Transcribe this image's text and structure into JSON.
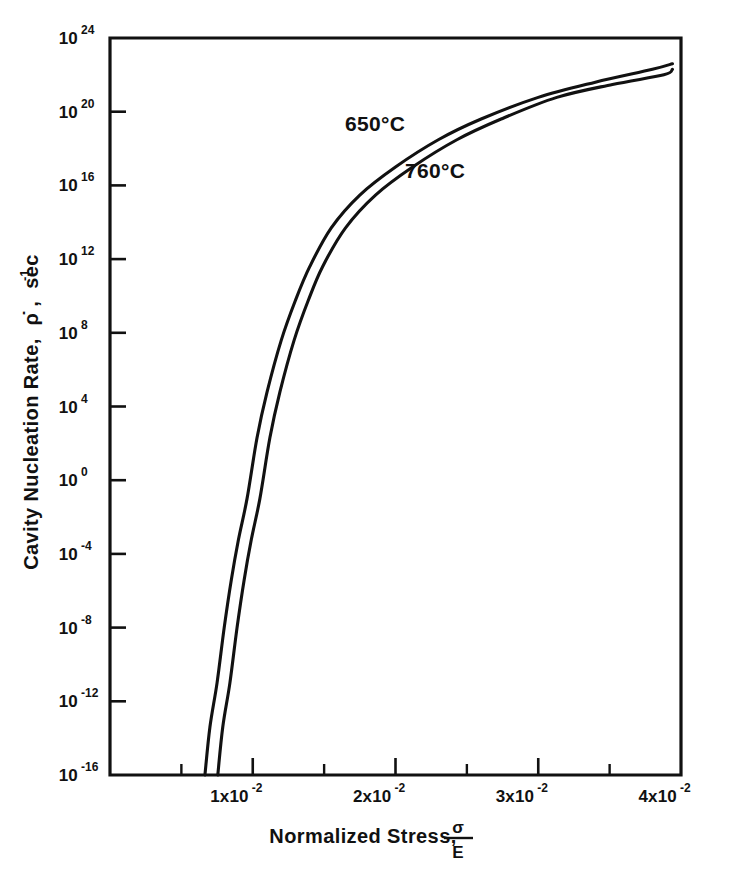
{
  "chart_data": {
    "type": "line",
    "title": "",
    "xlabel": "Normalized Stress, σ/E",
    "xlabel_main": "Normalized Stress,",
    "xlabel_frac_numerator": "σ",
    "xlabel_frac_denominator": "E",
    "ylabel": "Cavity Nucleation Rate, ρ̇ , sec⁻¹",
    "ylabel_main": "Cavity Nucleation Rate,",
    "ylabel_symbol": "ρ̇",
    "ylabel_unit": "sec",
    "ylabel_unit_exp": "-1",
    "xscale": "linear",
    "yscale": "log",
    "xlim": [
      0.0,
      0.04
    ],
    "ylim": [
      1e-16,
      1e+24
    ],
    "grid": false,
    "legend_position": "inline-annotation",
    "x_ticks": [
      {
        "value": 0.0,
        "label": "",
        "mantissa": "",
        "base": "",
        "exponent": "",
        "major": true,
        "labeled": false
      },
      {
        "value": 0.005,
        "label": "",
        "mantissa": "",
        "base": "",
        "exponent": "",
        "major": false,
        "labeled": false
      },
      {
        "value": 0.01,
        "label": "1x10-2",
        "mantissa": "1x",
        "base": "10",
        "exponent": "-2",
        "major": true,
        "labeled": true
      },
      {
        "value": 0.015,
        "label": "",
        "mantissa": "",
        "base": "",
        "exponent": "",
        "major": false,
        "labeled": false
      },
      {
        "value": 0.02,
        "label": "2x10-2",
        "mantissa": "2x",
        "base": "10",
        "exponent": "-2",
        "major": true,
        "labeled": true
      },
      {
        "value": 0.025,
        "label": "",
        "mantissa": "",
        "base": "",
        "exponent": "",
        "major": false,
        "labeled": false
      },
      {
        "value": 0.03,
        "label": "3x10-2",
        "mantissa": "3x",
        "base": "10",
        "exponent": "-2",
        "major": true,
        "labeled": true
      },
      {
        "value": 0.035,
        "label": "",
        "mantissa": "",
        "base": "",
        "exponent": "",
        "major": false,
        "labeled": false
      },
      {
        "value": 0.04,
        "label": "4x10-2",
        "mantissa": "4x",
        "base": "10",
        "exponent": "-2",
        "major": true,
        "labeled": true
      }
    ],
    "y_ticks": [
      {
        "exponent": 24,
        "base": "10",
        "label": "1024"
      },
      {
        "exponent": 20,
        "base": "10",
        "label": "1020"
      },
      {
        "exponent": 16,
        "base": "10",
        "label": "1016"
      },
      {
        "exponent": 12,
        "base": "10",
        "label": "1012"
      },
      {
        "exponent": 8,
        "base": "10",
        "label": "108"
      },
      {
        "exponent": 4,
        "base": "10",
        "label": "104"
      },
      {
        "exponent": 0,
        "base": "10",
        "label": "100"
      },
      {
        "exponent": -4,
        "base": "10",
        "label": "10-4"
      },
      {
        "exponent": -8,
        "base": "10",
        "label": "10-8"
      },
      {
        "exponent": -12,
        "base": "10",
        "label": "10-12"
      },
      {
        "exponent": -16,
        "base": "10",
        "label": "10-16"
      }
    ],
    "series": [
      {
        "name": "650°C",
        "annotation": "650°C",
        "color": "#111111",
        "points": [
          [
            0.00665,
            1e-16
          ],
          [
            0.007,
            4e-14
          ],
          [
            0.0075,
            1e-11
          ],
          [
            0.008,
            1e-08
          ],
          [
            0.0085,
            4e-06
          ],
          [
            0.009,
            0.0006
          ],
          [
            0.0096,
            0.1
          ],
          [
            0.0103,
            200.0
          ],
          [
            0.011,
            60000.0
          ],
          [
            0.012,
            40000000.0
          ],
          [
            0.013,
            6000000000.0
          ],
          [
            0.014,
            400000000000.0
          ],
          [
            0.0155,
            50000000000000.0
          ],
          [
            0.0175,
            3000000000000000.0
          ],
          [
            0.02,
            1e+17
          ],
          [
            0.023,
            3e+18
          ],
          [
            0.026,
            4e+19
          ],
          [
            0.03,
            6e+20
          ],
          [
            0.034,
            4e+21
          ],
          [
            0.038,
            2e+22
          ],
          [
            0.0394,
            4e+22
          ]
        ]
      },
      {
        "name": "760°C",
        "annotation": "760°C",
        "color": "#111111",
        "points": [
          [
            0.00755,
            1e-16
          ],
          [
            0.0079,
            4e-14
          ],
          [
            0.0084,
            1e-11
          ],
          [
            0.0089,
            1e-08
          ],
          [
            0.0094,
            4e-06
          ],
          [
            0.0099,
            0.0006
          ],
          [
            0.0105,
            0.1
          ],
          [
            0.0112,
            200.0
          ],
          [
            0.0119,
            60000.0
          ],
          [
            0.0129,
            40000000.0
          ],
          [
            0.0139,
            6000000000.0
          ],
          [
            0.0149,
            400000000000.0
          ],
          [
            0.0165,
            50000000000000.0
          ],
          [
            0.0186,
            3000000000000000.0
          ],
          [
            0.0212,
            1e+17
          ],
          [
            0.0243,
            3e+18
          ],
          [
            0.0274,
            4e+19
          ],
          [
            0.0313,
            6e+20
          ],
          [
            0.0352,
            3e+21
          ],
          [
            0.0388,
            1e+22
          ],
          [
            0.0394,
            2e+22
          ]
        ]
      }
    ],
    "annotations": [
      {
        "text": "650°C",
        "x_px": 345,
        "y_px": 131,
        "series": "650°C"
      },
      {
        "text": "760°C",
        "x_px": 405,
        "y_px": 178,
        "series": "760°C"
      }
    ]
  }
}
